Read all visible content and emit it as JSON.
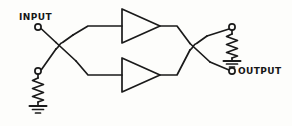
{
  "diagram": {
    "kind": "schematic",
    "stroke_color": "#1a1a1a",
    "background_color": "#fdfdfb",
    "width": 292,
    "height": 126,
    "terminals": [
      {
        "id": "input",
        "label": "INPUT",
        "x": 38,
        "y": 27,
        "label_x": 19,
        "label_y": 13
      },
      {
        "id": "output",
        "label": "OUTPUT",
        "x": 232,
        "y": 71,
        "label_x": 238,
        "label_y": 67
      },
      {
        "id": "r1_top",
        "label": "",
        "x": 38,
        "y": 71
      },
      {
        "id": "r2_top",
        "label": "",
        "x": 232,
        "y": 27
      }
    ],
    "components": [
      {
        "id": "amp-top",
        "type": "amplifier",
        "orientation": "right",
        "tip_x": 160,
        "tip_y": 26,
        "base_x": 122,
        "base_y": 26,
        "half_height": 17
      },
      {
        "id": "amp-bottom",
        "type": "amplifier",
        "orientation": "right",
        "tip_x": 160,
        "tip_y": 75,
        "base_x": 122,
        "base_y": 75,
        "half_height": 17
      },
      {
        "id": "resistor-left",
        "type": "resistor",
        "x": 38,
        "y_top": 74,
        "y_bottom": 104,
        "zigzags": 6
      },
      {
        "id": "resistor-right",
        "type": "resistor",
        "x": 232,
        "y_top": 30,
        "y_bottom": 58,
        "zigzags": 6
      },
      {
        "id": "ground-left",
        "type": "ground",
        "x": 38,
        "y": 104,
        "bars": 3
      },
      {
        "id": "ground-right",
        "type": "ground",
        "x": 232,
        "y": 58,
        "bars": 3
      }
    ],
    "junctions": [
      {
        "id": "crossover-left",
        "type": "wire-hop",
        "x": 60,
        "y": 45
      },
      {
        "id": "crossover-right",
        "type": "wire-hop",
        "x": 194,
        "y": 46
      }
    ]
  }
}
